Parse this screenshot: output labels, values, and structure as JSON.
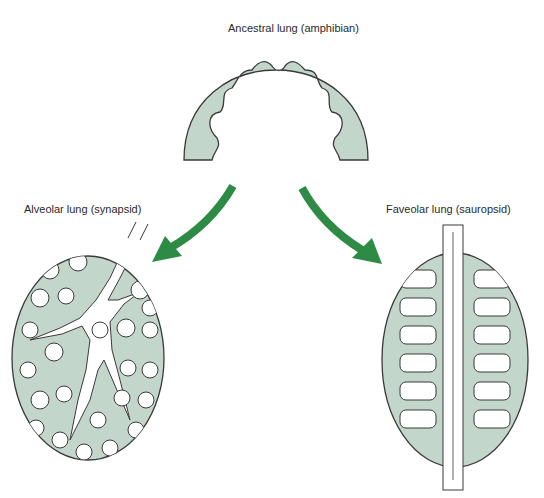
{
  "labels": {
    "ancestral": "Ancestral lung (amphibian)",
    "alveolar": "Alveolar lung (synapsid)",
    "faveolar": "Faveolar lung (sauropsid)"
  },
  "colors": {
    "lung_fill": "#c2d6cb",
    "outline": "#3a3a3a",
    "arrow_green": "#2e8b45",
    "background": "#ffffff"
  }
}
